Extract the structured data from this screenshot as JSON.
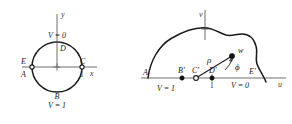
{
  "figure": {
    "left_panel": {
      "axes": {
        "x_label": "x",
        "y_label": "y"
      },
      "boundary_labels": {
        "top": "V = 0",
        "bottom": "V = 1"
      },
      "points": [
        {
          "id": "D",
          "label": "D",
          "position": "top"
        },
        {
          "id": "B",
          "label": "B",
          "position": "bottom"
        },
        {
          "id": "C",
          "label": "C",
          "position": "right"
        },
        {
          "id": "E",
          "label": "E",
          "position": "left-upper"
        },
        {
          "id": "A",
          "label": "A",
          "position": "left-lower"
        }
      ],
      "tick_label": "1",
      "center_marker": "+"
    },
    "right_panel": {
      "axes": {
        "u_label": "u",
        "v_label": "v"
      },
      "boundary_labels": {
        "left_segment": "V = 1",
        "right_segment": "V = 0"
      },
      "points": [
        {
          "id": "A-prime",
          "label": "A'",
          "marker": "none"
        },
        {
          "id": "B-prime",
          "label": "B'",
          "marker": "filled"
        },
        {
          "id": "C-prime",
          "label": "C'",
          "marker": "open"
        },
        {
          "id": "D-prime",
          "label": "D'",
          "marker": "filled"
        },
        {
          "id": "E-prime",
          "label": "E'",
          "marker": "none"
        },
        {
          "id": "w",
          "label": "w",
          "marker": "filled"
        }
      ],
      "tick_label": "1",
      "annotations": [
        {
          "id": "rho",
          "label": "ρ"
        },
        {
          "id": "phi",
          "label": "ϕ"
        }
      ]
    }
  }
}
